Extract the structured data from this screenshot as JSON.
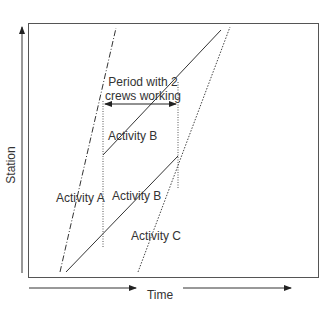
{
  "diagram": {
    "type": "linear-scheduling-diagram",
    "y_axis_label": "Station",
    "x_axis_label": "Time",
    "annotation": {
      "line1": "Period with 2",
      "line2": "crews working"
    },
    "activities": [
      {
        "id": "A",
        "label": "Activity A",
        "line_style": "dash-dot"
      },
      {
        "id": "B_lower",
        "label": "Activity B",
        "line_style": "solid"
      },
      {
        "id": "B_upper",
        "label": "Activity B",
        "line_style": "solid"
      },
      {
        "id": "C",
        "label": "Activity C",
        "line_style": "dotted"
      }
    ],
    "colors": {
      "line": "#333333",
      "frame": "#555555",
      "text": "#333333",
      "background": "#ffffff"
    }
  }
}
